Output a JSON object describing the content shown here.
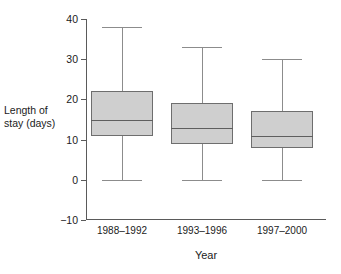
{
  "chart_data": {
    "type": "box",
    "title": "",
    "xlabel": "Year",
    "ylabel": "Length of stay (days)",
    "ylabel_line1": "Length of",
    "ylabel_line2": "stay (days)",
    "ylim": [
      -10,
      40
    ],
    "yticks": [
      40,
      30,
      20,
      10,
      0,
      -10
    ],
    "ytick_labels": [
      "40",
      "30",
      "20",
      "10",
      "0",
      "−10"
    ],
    "grid": false,
    "legend": null,
    "categories": [
      "1988–1992",
      "1993–1996",
      "1997–2000"
    ],
    "boxes": [
      {
        "category": "1988–1992",
        "whisker_low": 0,
        "q1": 11,
        "median": 15,
        "q3": 22,
        "whisker_high": 38
      },
      {
        "category": "1993–1996",
        "whisker_low": 0,
        "q1": 9,
        "median": 13,
        "q3": 19,
        "whisker_high": 33
      },
      {
        "category": "1997–2000",
        "whisker_low": 0,
        "q1": 8,
        "median": 11,
        "q3": 17,
        "whisker_high": 30
      }
    ],
    "colors": {
      "box_fill": "#cfcfcf",
      "box_edge": "#6e6e6e",
      "median": "#5f5f5f",
      "whisker": "#8c8c8c",
      "axis": "#5a5a5a",
      "text": "#1b1b1b",
      "background": "#ffffff"
    }
  }
}
